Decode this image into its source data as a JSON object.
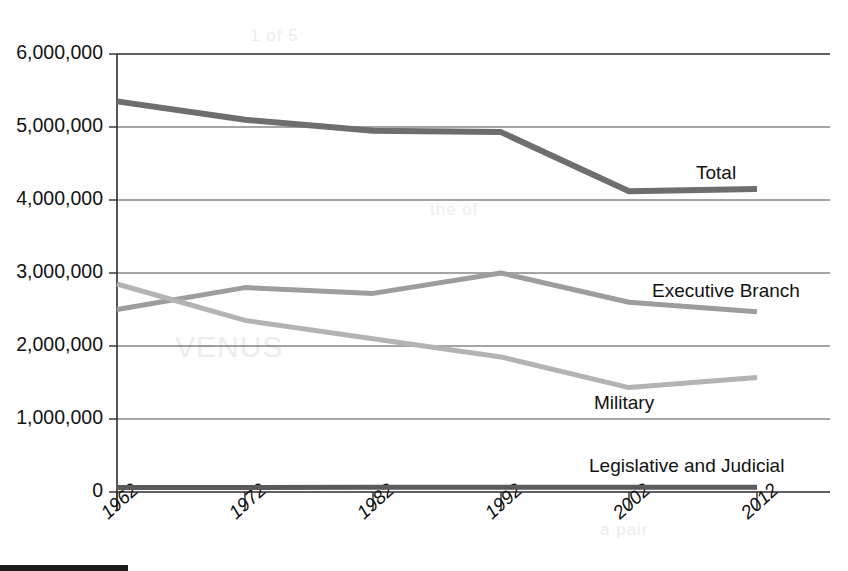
{
  "figure": {
    "background": "#ffffff",
    "ink": "#121212"
  },
  "axes": {
    "y_ticks": [
      "0",
      "1,000,000",
      "2,000,000",
      "3,000,000",
      "4,000,000",
      "5,000,000",
      "6,000,000"
    ],
    "y_tick_values": [
      0,
      1000000,
      2000000,
      3000000,
      4000000,
      5000000,
      6000000
    ],
    "x_ticks": [
      "1962",
      "1972",
      "1982",
      "1992",
      "2002",
      "2012"
    ],
    "x_tick_values": [
      1962,
      1972,
      1982,
      1992,
      2002,
      2012
    ]
  },
  "series_labels": {
    "total": "Total",
    "executive": "Executive Branch",
    "military": "Military",
    "legislative_judicial": "Legislative and Judicial"
  },
  "scan_ghosts": [
    "1 of 5",
    "VENUS",
    "the of",
    "a pair"
  ],
  "chart_data": {
    "type": "line",
    "title": "",
    "subtitle": "",
    "xlabel": "",
    "ylabel": "",
    "x": [
      1962,
      1972,
      1982,
      1992,
      2002,
      2012
    ],
    "categories": [
      "1962",
      "1972",
      "1982",
      "1992",
      "2002",
      "2012"
    ],
    "xlim": [
      1962,
      2012
    ],
    "ylim": [
      0,
      6000000
    ],
    "grid": true,
    "legend": "inline-right-of-series",
    "y_tick_step": 1000000,
    "series": [
      {
        "name": "Total",
        "color": "#6e6e6e",
        "line_width": 6,
        "values": [
          5350000,
          5100000,
          4950000,
          4930000,
          4120000,
          4150000
        ],
        "label_x": 1995,
        "label_y": 4480000
      },
      {
        "name": "Executive Branch",
        "color": "#9d9d9d",
        "line_width": 5,
        "values": [
          2500000,
          2800000,
          2720000,
          3000000,
          2600000,
          2470000
        ],
        "label_x": 1999,
        "label_y": 2820000
      },
      {
        "name": "Military",
        "color": "#b3b3b3",
        "line_width": 5,
        "values": [
          2850000,
          2350000,
          2100000,
          1850000,
          1430000,
          1570000
        ],
        "label_x": 1997,
        "label_y": 1230000
      },
      {
        "name": "Legislative and Judicial",
        "color": "#5a5a5a",
        "line_width": 5,
        "values": [
          62000,
          63000,
          64000,
          66000,
          65000,
          64000
        ],
        "label_x": 1999,
        "label_y": 390000
      }
    ]
  }
}
